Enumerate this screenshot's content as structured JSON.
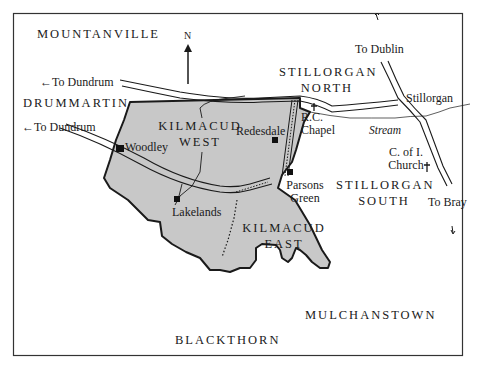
{
  "map": {
    "north_label": "N",
    "townlands": {
      "mountanville": "MOUNTANVILLE",
      "drummartin": "DRUMMARTIN",
      "kilmacud_west_1": "KILMACUD",
      "kilmacud_west_2": "WEST",
      "kilmacud_east_1": "KILMACUD",
      "kilmacud_east_2": "EAST",
      "stillorgan_north_1": "STILLORGAN",
      "stillorgan_north_2": "NORTH",
      "stillorgan_south_1": "STILLORGAN",
      "stillorgan_south_2": "SOUTH",
      "blackthorn": "BLACKTHORN",
      "mulchanstown": "MULCHANSTOWN"
    },
    "roads": {
      "to_dundrum_upper": "←To Dundrum",
      "to_dundrum_lower": "←To Dundrum",
      "to_dublin": "To Dublin",
      "to_bray": "To Bray"
    },
    "places": {
      "woodley": "Woodley",
      "redesdale": "Redesdale",
      "rc_chapel_1": "R.C.",
      "rc_chapel_2": "Chapel",
      "parsons_green_1": "Parsons",
      "parsons_green_2": "Green",
      "lakelands": "Lakelands",
      "stillorgan": "Stillorgan",
      "coi_church_1": "C. of I.",
      "coi_church_2": "Church",
      "stream": "Stream"
    },
    "colors": {
      "fill": "#c8c8c8",
      "ink": "#1a1a1a"
    }
  }
}
